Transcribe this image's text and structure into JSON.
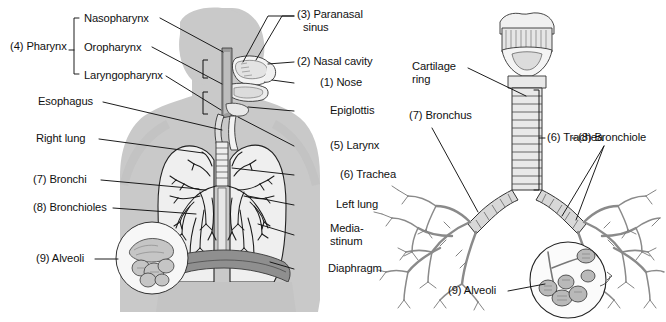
{
  "figure": {
    "title_visible": false,
    "background_color": "#ffffff",
    "ink_color": "#111111",
    "body_fill": "#c9c9c9",
    "organ_fill": "#efefef",
    "diaphragm_fill": "#8f8f8f"
  },
  "left_figure": {
    "name": "head-neck-thorax-respiratory-overview",
    "bracket_group": {
      "label": "(4) Pharynx",
      "members": [
        "Nasopharynx",
        "Oropharynx",
        "Laryngopharynx"
      ]
    },
    "left_labels": [
      {
        "text": "(4) Pharynx",
        "x": 10,
        "y": 46
      },
      {
        "text": "Nasopharynx",
        "x": 84,
        "y": 21
      },
      {
        "text": "Oropharynx",
        "x": 84,
        "y": 50
      },
      {
        "text": "Laryngopharynx",
        "x": 84,
        "y": 77
      },
      {
        "text": "Esophagus",
        "x": 38,
        "y": 103
      },
      {
        "text": "Right lung",
        "x": 36,
        "y": 139
      },
      {
        "text": "(7) Bronchi",
        "x": 33,
        "y": 180
      },
      {
        "text": "(8) Bronchioles",
        "x": 33,
        "y": 208
      },
      {
        "text": "(9) Alveoli",
        "x": 36,
        "y": 259
      }
    ],
    "right_labels": [
      {
        "text": "(3) Paranasal",
        "x": 297,
        "y": 15
      },
      {
        "text": "sinus",
        "x": 303,
        "y": 28
      },
      {
        "text": "(2) Nasal cavity",
        "x": 297,
        "y": 62
      },
      {
        "text": "(1) Nose",
        "x": 320,
        "y": 83
      },
      {
        "text": "Epiglottis",
        "x": 330,
        "y": 111
      },
      {
        "text": "(5) Larynx",
        "x": 330,
        "y": 146
      },
      {
        "text": "(6) Trachea",
        "x": 340,
        "y": 175
      },
      {
        "text": "Left lung",
        "x": 336,
        "y": 205
      },
      {
        "text": "Media-",
        "x": 330,
        "y": 229
      },
      {
        "text": "stinum",
        "x": 330,
        "y": 242
      },
      {
        "text": "Diaphragm",
        "x": 328,
        "y": 269
      }
    ]
  },
  "right_figure": {
    "name": "tracheobronchial-tree",
    "labels": [
      {
        "text": "Cartilage",
        "x": 412,
        "y": 67
      },
      {
        "text": "ring",
        "x": 412,
        "y": 80
      },
      {
        "text": "(7) Bronchus",
        "x": 409,
        "y": 116
      },
      {
        "text": "(6) Trachea",
        "x": 542,
        "y": 116
      },
      {
        "text": "(8) Bronchiole",
        "x": 578,
        "y": 136
      },
      {
        "text": "(9) Alveoli",
        "x": 448,
        "y": 291
      }
    ],
    "bracket_label": "(6) Trachea"
  },
  "numbered_key": [
    {
      "n": "(1)",
      "term": "Nose"
    },
    {
      "n": "(2)",
      "term": "Nasal cavity"
    },
    {
      "n": "(3)",
      "term": "Paranasal sinus"
    },
    {
      "n": "(4)",
      "term": "Pharynx"
    },
    {
      "n": "(5)",
      "term": "Larynx"
    },
    {
      "n": "(6)",
      "term": "Trachea"
    },
    {
      "n": "(7)",
      "term": "Bronchi / Bronchus"
    },
    {
      "n": "(8)",
      "term": "Bronchioles / Bronchiole"
    },
    {
      "n": "(9)",
      "term": "Alveoli"
    }
  ],
  "unnumbered_terms": [
    "Nasopharynx",
    "Oropharynx",
    "Laryngopharynx",
    "Esophagus",
    "Right lung",
    "Left lung",
    "Epiglottis",
    "Mediastinum",
    "Diaphragm",
    "Cartilage ring"
  ]
}
